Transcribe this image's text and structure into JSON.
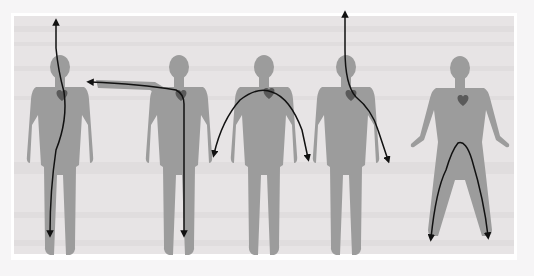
{
  "diagram": {
    "title": "",
    "colors": {
      "page_background": "#f6f5f6",
      "panel_background": "#e7e4e5",
      "panel_border": "#ffffff",
      "silhouette": "#9c9c9c",
      "heart": "#5a5a5a",
      "current_path": "#111111"
    },
    "figures": [
      {
        "id": 1,
        "pose": "arms-down",
        "path": "head-to-left-foot",
        "entry": "head",
        "exit": "left foot"
      },
      {
        "id": 2,
        "pose": "right-arm-raised",
        "path": "right-hand-to-right-foot",
        "entry": "right hand",
        "exit": "right foot"
      },
      {
        "id": 3,
        "pose": "arms-down",
        "path": "right-hand-to-left-hand",
        "entry": "right hand",
        "exit": "left hand"
      },
      {
        "id": 4,
        "pose": "arms-down",
        "path": "head-to-left-hand",
        "entry": "head",
        "exit": "left hand"
      },
      {
        "id": 5,
        "pose": "legs-apart",
        "path": "right-foot-to-left-foot",
        "entry": "right foot",
        "exit": "left foot"
      }
    ]
  }
}
